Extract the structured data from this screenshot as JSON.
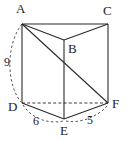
{
  "figure": {
    "type": "triangular-prism-diagram",
    "stroke_color": "#2b2b2b",
    "dashed_color": "#4a4a4a",
    "background": "#ffffff",
    "vertices": [
      {
        "id": "A",
        "label": "A",
        "x": 22,
        "y": 24,
        "label_x": 16,
        "label_y": 2
      },
      {
        "id": "C",
        "label": "C",
        "x": 108,
        "y": 24,
        "label_x": 103,
        "label_y": 4
      },
      {
        "id": "B",
        "label": "B",
        "x": 64,
        "y": 40,
        "label_x": 68,
        "label_y": 42
      },
      {
        "id": "D",
        "label": "D",
        "x": 22,
        "y": 103,
        "label_x": 8,
        "label_y": 100
      },
      {
        "id": "F",
        "label": "F",
        "x": 108,
        "y": 103,
        "label_x": 112,
        "label_y": 97
      },
      {
        "id": "E",
        "label": "E",
        "x": 64,
        "y": 119,
        "label_x": 60,
        "label_y": 124
      }
    ],
    "solid_edges": [
      {
        "name": "edge-AC",
        "from": "A",
        "to": "C"
      },
      {
        "name": "edge-AB",
        "from": "A",
        "to": "B"
      },
      {
        "name": "edge-BC",
        "from": "B",
        "to": "C"
      },
      {
        "name": "edge-AD",
        "from": "A",
        "to": "D"
      },
      {
        "name": "edge-BE",
        "from": "B",
        "to": "E"
      },
      {
        "name": "edge-CF",
        "from": "C",
        "to": "F"
      },
      {
        "name": "edge-DE",
        "from": "D",
        "to": "E"
      },
      {
        "name": "edge-EF",
        "from": "E",
        "to": "F"
      },
      {
        "name": "diagonal-AF",
        "from": "A",
        "to": "F"
      }
    ],
    "dashed_edges": [
      {
        "name": "hidden-edge-DF",
        "from": "D",
        "to": "F"
      }
    ],
    "measure_arcs": [
      {
        "name": "arc-height-AD",
        "from": "A",
        "to": "D",
        "measure": "9"
      },
      {
        "name": "arc-base-DE",
        "from": "D",
        "to": "E",
        "measure": "6"
      },
      {
        "name": "arc-base-EF",
        "from": "E",
        "to": "F",
        "measure": "5"
      }
    ],
    "measures": {
      "height_AD": "9",
      "base_DE": "6",
      "base_EF": "5"
    }
  }
}
